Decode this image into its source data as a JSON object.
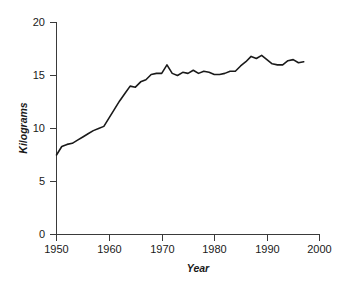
{
  "chart_data": {
    "type": "line",
    "title": "",
    "subtitle": "",
    "xlabel": "Year",
    "ylabel": "Kilograms",
    "xlim": [
      1950,
      2000
    ],
    "ylim": [
      0,
      20
    ],
    "xticks": [
      1950,
      1960,
      1970,
      1980,
      1990,
      2000
    ],
    "xticklabels": [
      "1950",
      "1960",
      "1970",
      "1980",
      "1990",
      "2000"
    ],
    "yticks": [
      0,
      5,
      10,
      15,
      20
    ],
    "yticklabels": [
      "0",
      "5",
      "10",
      "15",
      "20"
    ],
    "grid": false,
    "legend": false,
    "legend_position": "none",
    "line_color": "#1a1a1a",
    "series": [
      {
        "name": "Kilograms",
        "x": [
          1950,
          1951,
          1952,
          1953,
          1954,
          1955,
          1956,
          1957,
          1958,
          1959,
          1960,
          1961,
          1962,
          1963,
          1964,
          1965,
          1966,
          1967,
          1968,
          1969,
          1970,
          1971,
          1972,
          1973,
          1974,
          1975,
          1976,
          1977,
          1978,
          1979,
          1980,
          1981,
          1982,
          1983,
          1984,
          1985,
          1986,
          1987,
          1988,
          1989,
          1990,
          1991,
          1992,
          1993,
          1994,
          1995,
          1996,
          1997
        ],
        "values": [
          7.5,
          8.3,
          8.5,
          8.6,
          8.9,
          9.2,
          9.5,
          9.8,
          10.0,
          10.2,
          11.0,
          11.8,
          12.6,
          13.3,
          14.0,
          13.9,
          14.4,
          14.6,
          15.1,
          15.2,
          15.2,
          16.0,
          15.2,
          15.0,
          15.3,
          15.2,
          15.5,
          15.2,
          15.4,
          15.3,
          15.1,
          15.1,
          15.2,
          15.4,
          15.4,
          15.9,
          16.3,
          16.8,
          16.6,
          16.9,
          16.5,
          16.1,
          16.0,
          16.0,
          16.4,
          16.5,
          16.2,
          16.3
        ]
      }
    ]
  },
  "axes": {
    "x_axis_name": "year-axis",
    "y_axis_name": "kilograms-axis"
  }
}
